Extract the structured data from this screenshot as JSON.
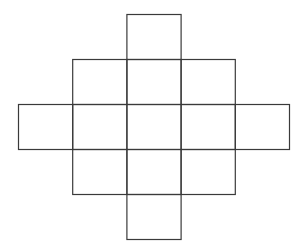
{
  "diagram": {
    "title": "",
    "grid_rows": 5,
    "grid_cols": 5,
    "cells": [
      {
        "row": 0,
        "col": 2
      },
      {
        "row": 1,
        "col": 1
      },
      {
        "row": 1,
        "col": 2
      },
      {
        "row": 1,
        "col": 3
      },
      {
        "row": 2,
        "col": 0
      },
      {
        "row": 2,
        "col": 1
      },
      {
        "row": 2,
        "col": 2
      },
      {
        "row": 2,
        "col": 3
      },
      {
        "row": 2,
        "col": 4
      },
      {
        "row": 3,
        "col": 1
      },
      {
        "row": 3,
        "col": 2
      },
      {
        "row": 3,
        "col": 3
      },
      {
        "row": 4,
        "col": 2
      }
    ],
    "stroke_color": "#3a3a3a",
    "background_color": "#ffffff"
  }
}
